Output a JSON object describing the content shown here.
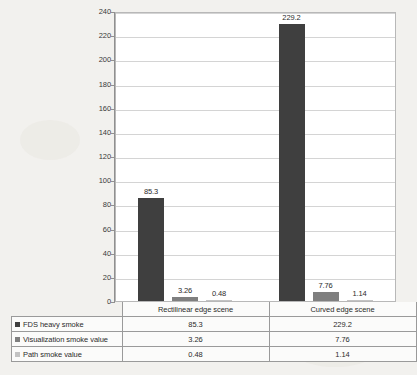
{
  "chart_data": {
    "type": "bar",
    "title": "",
    "xlabel": "",
    "ylabel": "",
    "ylim": [
      0,
      240
    ],
    "ytick_step": 20,
    "grid": true,
    "legend_position": "data-table",
    "categories": [
      "Rectilinear edge scene",
      "Curved edge scene"
    ],
    "series": [
      {
        "name": "FDS heavy smoke",
        "color": "#3f3f3f",
        "values": [
          85.3,
          229.2
        ],
        "labels": [
          "85.3",
          "229.2"
        ]
      },
      {
        "name": "Visualization smoke value",
        "color": "#7f7f7f",
        "values": [
          3.26,
          7.76
        ],
        "labels": [
          "3.26",
          "7.76"
        ]
      },
      {
        "name": "Path smoke value",
        "color": "#c3c3c3",
        "values": [
          0.48,
          1.14
        ],
        "labels": [
          "0.48",
          "1.14"
        ]
      }
    ],
    "ytick_labels": [
      "0",
      "20",
      "40",
      "60",
      "80",
      "100",
      "120",
      "140",
      "160",
      "180",
      "200",
      "220",
      "240"
    ]
  },
  "table": {
    "corner_label": "",
    "column_headers": [
      "Rectilinear edge scene",
      "Curved edge scene"
    ],
    "rows": [
      {
        "series": "FDS heavy smoke",
        "swatch": "#3f3f3f",
        "cells": [
          "85.3",
          "229.2"
        ]
      },
      {
        "series": "Visualization smoke value",
        "swatch": "#7f7f7f",
        "cells": [
          "3.26",
          "7.76"
        ]
      },
      {
        "series": "Path smoke value",
        "swatch": "#c3c3c3",
        "cells": [
          "0.48",
          "1.14"
        ]
      }
    ]
  },
  "colors": {
    "background": "#f2f1ee",
    "plot_background": "#ffffff",
    "gridline": "#d4d4d4",
    "axis": "#909090",
    "text": "#2b2b2b",
    "table_border": "#9a9a9a"
  }
}
